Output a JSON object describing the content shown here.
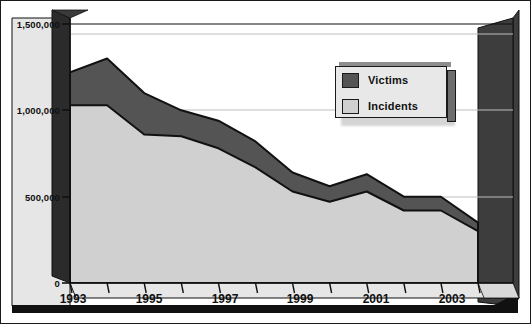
{
  "chart_data": {
    "type": "area",
    "title": "",
    "subtitle": "",
    "xlabel": "",
    "ylabel": "",
    "grid": true,
    "legend_position": "top-right",
    "ylim": [
      0,
      1500000
    ],
    "yticks": [
      0,
      500000,
      1000000,
      1500000
    ],
    "ytick_labels": [
      "0",
      "500,000",
      "1,000,000",
      "1,500,000"
    ],
    "x": [
      1993,
      1994,
      1995,
      1996,
      1997,
      1998,
      1999,
      2000,
      2001,
      2002,
      2003,
      2004
    ],
    "categories": [
      "1993",
      "1994",
      "1995",
      "1996",
      "1997",
      "1998",
      "1999",
      "2000",
      "2001",
      "2002",
      "2003",
      "2004"
    ],
    "xtick_labels": [
      "1993",
      "1995",
      "1997",
      "1999",
      "2001",
      "2003"
    ],
    "xtick_values": [
      1993,
      1995,
      1997,
      1999,
      2001,
      2003
    ],
    "series": [
      {
        "name": "Victims",
        "color": "#545454",
        "values": [
          1220000,
          1300000,
          1100000,
          1000000,
          940000,
          820000,
          640000,
          560000,
          630000,
          500000,
          500000,
          350000
        ]
      },
      {
        "name": "Incidents",
        "color": "#d0d0d0",
        "values": [
          1030000,
          1030000,
          860000,
          850000,
          780000,
          670000,
          530000,
          470000,
          530000,
          420000,
          420000,
          300000
        ]
      }
    ]
  },
  "legend": {
    "items": [
      {
        "label": "Victims",
        "color": "#545454"
      },
      {
        "label": "Incidents",
        "color": "#d0d0d0"
      }
    ]
  },
  "axes": {
    "y": {
      "ticks": [
        {
          "label": "1,500,000",
          "value": 1500000
        },
        {
          "label": "1,000,000",
          "value": 1000000
        },
        {
          "label": "500,000",
          "value": 500000
        },
        {
          "label": "0",
          "value": 0
        }
      ]
    },
    "x": {
      "ticks": [
        {
          "label": "1993",
          "value": 1993
        },
        {
          "label": "1995",
          "value": 1995
        },
        {
          "label": "1997",
          "value": 1997
        },
        {
          "label": "1999",
          "value": 1999
        },
        {
          "label": "2001",
          "value": 2001
        },
        {
          "label": "2003",
          "value": 2003
        }
      ]
    }
  },
  "colors": {
    "victims": "#545454",
    "incidents": "#d0d0d0",
    "plot_background": "#ffffff",
    "wall_side": "#2b2b2b",
    "floor": "#e6e6e6",
    "outline": "#111111"
  }
}
